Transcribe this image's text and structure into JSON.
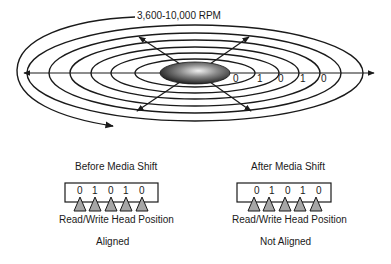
{
  "platter": {
    "rpm_label": "3,600-10,000 RPM",
    "track_bits": [
      "0",
      "1",
      "0",
      "1",
      "0"
    ]
  },
  "before": {
    "title": "Before Media Shift",
    "bits": [
      "0",
      "1",
      "0",
      "1",
      "0"
    ],
    "head_label": "Read/Write Head Position",
    "status": "Aligned"
  },
  "after": {
    "title": "After Media Shift",
    "bits": [
      "0",
      "1",
      "0",
      "1",
      "0"
    ],
    "head_label": "Read/Write Head Position",
    "status": "Not Aligned"
  },
  "colors": {
    "line": "#1a1a1a",
    "head_fill": "#a6a6a6",
    "spindle_dark": "#2a2a2a",
    "spindle_light": "#e8e8e8"
  }
}
